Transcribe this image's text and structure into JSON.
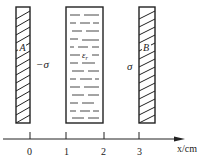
{
  "diagram": {
    "plate_a": {
      "label": "A",
      "charge_label": "−σ"
    },
    "dielectric": {
      "label": "ε",
      "subscript": "r"
    },
    "plate_b": {
      "label": "B",
      "charge_label": "σ"
    },
    "axis": {
      "label": "x/cm",
      "ticks": [
        "0",
        "1",
        "2",
        "3"
      ]
    },
    "colors": {
      "stroke": "#222222",
      "background": "#ffffff"
    }
  }
}
